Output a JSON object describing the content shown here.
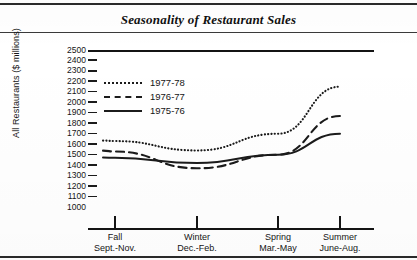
{
  "figure": {
    "title": "Seasonality of Restaurant Sales"
  },
  "chart_data": {
    "type": "line",
    "title": "Seasonality of Restaurant Sales",
    "xlabel": "",
    "ylabel": "All Restaurants ($ millions)",
    "categories": [
      "Fall",
      "Winter",
      "Spring",
      "Summer"
    ],
    "category_sublabels": [
      "Sept.-Nov.",
      "Dec.-Feb.",
      "Mar.-May",
      "June-Aug."
    ],
    "ylim": [
      1000,
      2500
    ],
    "ytick_step": 100,
    "ytick_labels": [
      "2500",
      "2400",
      "2300",
      "2200",
      "2100",
      "2000",
      "1900",
      "1800",
      "1700",
      "1600",
      "1500",
      "1400",
      "1300",
      "1200",
      "1100",
      "1000"
    ],
    "grid": false,
    "legend_position": "upper-left-inside",
    "series": [
      {
        "name": "1977-78",
        "style": "dotted",
        "color": "#1b1b1b",
        "values": [
          1630,
          1540,
          1700,
          2150
        ]
      },
      {
        "name": "1976-77",
        "style": "dashed",
        "color": "#1b1b1b",
        "values": [
          1530,
          1370,
          1500,
          1870
        ]
      },
      {
        "name": "1975-76",
        "style": "solid",
        "color": "#1b1b1b",
        "values": [
          1470,
          1420,
          1500,
          1700
        ]
      }
    ]
  },
  "axis": {
    "y_title": "All Restaurants ($ millions)"
  }
}
